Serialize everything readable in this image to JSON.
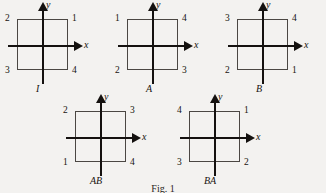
{
  "figure": {
    "caption": "Fig. 1",
    "axis_labels": {
      "x": "x",
      "y": "y"
    },
    "panels": [
      {
        "name": "I",
        "position": {
          "left": 0,
          "top": 0
        },
        "corners": {
          "top_left": "2",
          "top_right": "1",
          "bottom_left": "3",
          "bottom_right": "4"
        }
      },
      {
        "name": "A",
        "position": {
          "left": 110,
          "top": 0
        },
        "corners": {
          "top_left": "1",
          "top_right": "4",
          "bottom_left": "2",
          "bottom_right": "3"
        }
      },
      {
        "name": "B",
        "position": {
          "left": 220,
          "top": 0
        },
        "corners": {
          "top_left": "3",
          "top_right": "4",
          "bottom_left": "2",
          "bottom_right": "1"
        }
      },
      {
        "name": "AB",
        "position": {
          "left": 58,
          "top": 92
        },
        "corners": {
          "top_left": "2",
          "top_right": "3",
          "bottom_left": "1",
          "bottom_right": "4"
        }
      },
      {
        "name": "BA",
        "position": {
          "left": 172,
          "top": 92
        },
        "corners": {
          "top_left": "4",
          "top_right": "1",
          "bottom_left": "3",
          "bottom_right": "2"
        }
      }
    ]
  }
}
